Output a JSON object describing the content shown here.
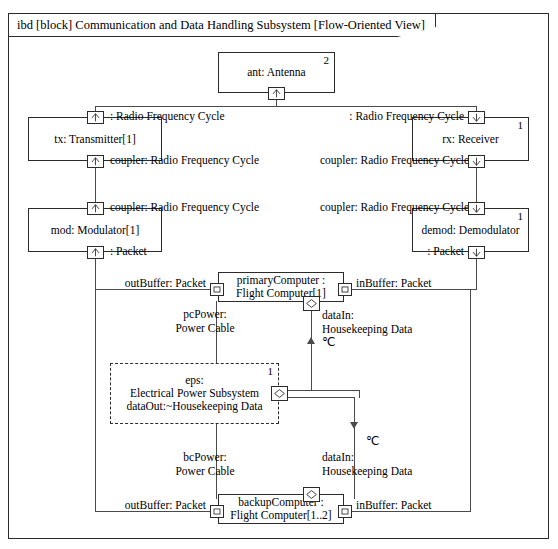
{
  "diagram": {
    "header": "ibd [block] Communication and Data Handling Subsystem [Flow-Oriented View]",
    "kind": "ibd",
    "block": "Communication and Data Handling Subsystem",
    "view": "Flow-Oriented View"
  },
  "parts": {
    "antenna": {
      "name": "ant: Antenna",
      "multiplicity": "2"
    },
    "transmitter": {
      "name": "tx: Transmitter[1]",
      "multiplicity": ""
    },
    "receiver": {
      "name": "rx: Receiver",
      "multiplicity": "1"
    },
    "modulator": {
      "name": "mod: Modulator[1]",
      "multiplicity": ""
    },
    "demodulator": {
      "name": "demod: Demodulator",
      "multiplicity": "1"
    },
    "primary_computer": {
      "line1": "primaryComputer :",
      "line2": "Flight Computer[1]",
      "multiplicity": ""
    },
    "backup_computer": {
      "line1": "backupComputer :",
      "line2": "Flight Computer[1..2]",
      "multiplicity": ""
    },
    "eps": {
      "line1": "eps:",
      "line2": "Electrical Power Subsystem",
      "line3": "dataOut:~Housekeeping Data",
      "multiplicity": "1"
    }
  },
  "port_labels": {
    "tx_top": ": Radio Frequency Cycle",
    "tx_bottom": "coupler: Radio Frequency Cycle",
    "rx_top": ": Radio Frequency Cycle",
    "rx_bottom": "coupler: Radio Frequency Cycle",
    "mod_top": "coupler: Radio Frequency Cycle",
    "mod_bottom": ": Packet",
    "demod_top": "coupler: Radio Frequency Cycle",
    "demod_bottom": ": Packet",
    "pc_out": "outBuffer: Packet",
    "pc_in": "inBuffer: Packet",
    "bc_out": "outBuffer: Packet",
    "bc_in": "inBuffer: Packet"
  },
  "connector_labels": {
    "pc_power_l1": "pcPower:",
    "pc_power_l2": "Power Cable",
    "bc_power_l1": "bcPower:",
    "bc_power_l2": "Power Cable",
    "pc_data_l1": "dataIn:",
    "pc_data_l2": "Housekeeping Data",
    "pc_data_unit": "℃",
    "bc_data_l1": "dataIn:",
    "bc_data_l2": "Housekeeping Data",
    "bc_data_unit": "℃"
  },
  "icons": {
    "proxy_port": "proxy-port-icon",
    "flow_port": "flow-port-icon",
    "full_port": "full-port-icon"
  },
  "colors": {
    "stroke": "#2b2b2b",
    "connector": "#4a4a4a",
    "background": "#ffffff"
  }
}
